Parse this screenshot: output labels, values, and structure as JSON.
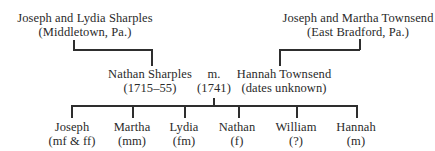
{
  "diagram": {
    "type": "family-tree",
    "paternal_grandparents": {
      "names": "Joseph and Lydia Sharples",
      "place": "(Middletown, Pa.)"
    },
    "maternal_grandparents": {
      "names": "Joseph and Martha Townsend",
      "place": "(East Bradford, Pa.)"
    },
    "father": {
      "name": "Nathan Sharples",
      "dates": "(1715–55)"
    },
    "marriage": {
      "label": "m.",
      "year": "(1741)"
    },
    "mother": {
      "name": "Hannah Townsend",
      "dates": "(dates unknown)"
    },
    "children": [
      {
        "name": "Joseph",
        "note": "(mf & ff)"
      },
      {
        "name": "Martha",
        "note": "(mm)"
      },
      {
        "name": "Lydia",
        "note": "(fm)"
      },
      {
        "name": "Nathan",
        "note": "(f)"
      },
      {
        "name": "William",
        "note": "(?)"
      },
      {
        "name": "Hannah",
        "note": "(m)"
      }
    ]
  }
}
